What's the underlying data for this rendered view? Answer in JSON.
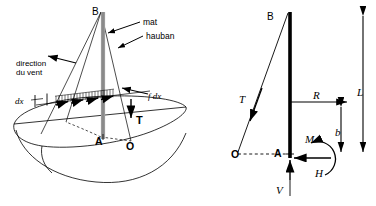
{
  "figure": {
    "background_color": "#ffffff",
    "line_color": "#000000",
    "mast_color": "#808080"
  },
  "left_diagram": {
    "name": "sailboat-pictorial-view",
    "labels": {
      "mast_top": "B",
      "mast_foot": "A",
      "shroud_anchor": "O",
      "mast_callout": "mat",
      "shroud_callout": "hauban",
      "wind_line1": "direction",
      "wind_line2": "du vent",
      "element_width": "dx",
      "element_force": "f dx",
      "shroud_tension": "T"
    }
  },
  "right_diagram": {
    "name": "free-body-diagram",
    "labels": {
      "mast_top": "B",
      "mast_foot": "A",
      "shroud_anchor": "O",
      "shroud_tension": "T",
      "resultant_force": "R",
      "mast_length": "L",
      "resultant_height": "b",
      "moment": "M",
      "horizontal_reaction": "H",
      "vertical_reaction": "V"
    }
  }
}
